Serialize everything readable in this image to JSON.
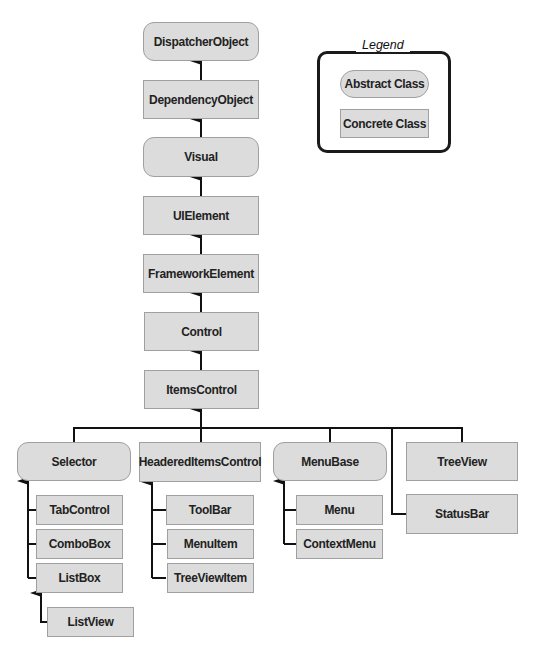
{
  "legend": {
    "title": "Legend",
    "abstract_label": "Abstract Class",
    "concrete_label": "Concrete Class"
  },
  "colors": {
    "box_fill": "#dcdcdc",
    "box_border": "#a0a0a0",
    "connector": "#111111"
  },
  "classes": {
    "dispatcher_object": "DispatcherObject",
    "dependency_object": "DependencyObject",
    "visual": "Visual",
    "ui_element": "UIElement",
    "framework_element": "FrameworkElement",
    "control": "Control",
    "items_control": "ItemsControl",
    "selector": "Selector",
    "headered_items_control": "HeaderedItemsControl",
    "menu_base": "MenuBase",
    "tree_view": "TreeView",
    "status_bar": "StatusBar",
    "tab_control": "TabControl",
    "combo_box": "ComboBox",
    "list_box": "ListBox",
    "list_view": "ListView",
    "tool_bar": "ToolBar",
    "menu_item": "MenuItem",
    "tree_view_item": "TreeViewItem",
    "menu": "Menu",
    "context_menu": "ContextMenu"
  },
  "hierarchy": [
    {
      "child": "DependencyObject",
      "parent": "DispatcherObject"
    },
    {
      "child": "Visual",
      "parent": "DependencyObject"
    },
    {
      "child": "UIElement",
      "parent": "Visual"
    },
    {
      "child": "FrameworkElement",
      "parent": "UIElement"
    },
    {
      "child": "Control",
      "parent": "FrameworkElement"
    },
    {
      "child": "ItemsControl",
      "parent": "Control"
    },
    {
      "child": "Selector",
      "parent": "ItemsControl"
    },
    {
      "child": "HeaderedItemsControl",
      "parent": "ItemsControl"
    },
    {
      "child": "MenuBase",
      "parent": "ItemsControl"
    },
    {
      "child": "TreeView",
      "parent": "ItemsControl"
    },
    {
      "child": "StatusBar",
      "parent": "ItemsControl"
    },
    {
      "child": "TabControl",
      "parent": "Selector"
    },
    {
      "child": "ComboBox",
      "parent": "Selector"
    },
    {
      "child": "ListBox",
      "parent": "Selector"
    },
    {
      "child": "ListView",
      "parent": "ListBox"
    },
    {
      "child": "ToolBar",
      "parent": "HeaderedItemsControl"
    },
    {
      "child": "MenuItem",
      "parent": "HeaderedItemsControl"
    },
    {
      "child": "TreeViewItem",
      "parent": "HeaderedItemsControl"
    },
    {
      "child": "Menu",
      "parent": "MenuBase"
    },
    {
      "child": "ContextMenu",
      "parent": "MenuBase"
    }
  ]
}
